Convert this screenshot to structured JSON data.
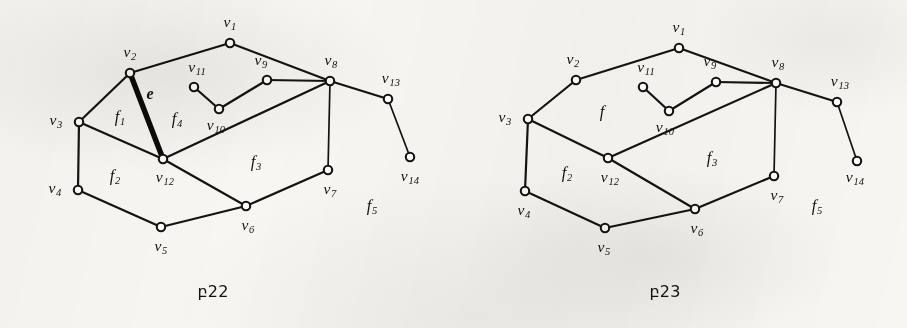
{
  "page": {
    "width": 907,
    "height": 328,
    "background_color": "#f7f6f3",
    "ink_color": "#15130f"
  },
  "chart_data": {
    "type": "diagram",
    "title": "",
    "figures": [
      {
        "id": "figure-22",
        "caption": "բ22",
        "caption_pos": {
          "x": 213,
          "y": 291
        },
        "vertices": [
          {
            "id": "v1",
            "label": "v",
            "sub": "1",
            "x": 230,
            "y": 43,
            "label_x": 230,
            "label_y": 23
          },
          {
            "id": "v2",
            "label": "v",
            "sub": "2",
            "x": 130,
            "y": 73,
            "label_x": 130,
            "label_y": 53
          },
          {
            "id": "v3",
            "label": "v",
            "sub": "3",
            "x": 79,
            "y": 122,
            "label_x": 56,
            "label_y": 121
          },
          {
            "id": "v4",
            "label": "v",
            "sub": "4",
            "x": 78,
            "y": 190,
            "label_x": 55,
            "label_y": 189
          },
          {
            "id": "v5",
            "label": "v",
            "sub": "5",
            "x": 161,
            "y": 227,
            "label_x": 161,
            "label_y": 247
          },
          {
            "id": "v6",
            "label": "v",
            "sub": "6",
            "x": 246,
            "y": 206,
            "label_x": 248,
            "label_y": 226
          },
          {
            "id": "v7",
            "label": "v",
            "sub": "7",
            "x": 328,
            "y": 170,
            "label_x": 330,
            "label_y": 190
          },
          {
            "id": "v8",
            "label": "v",
            "sub": "8",
            "x": 330,
            "y": 81,
            "label_x": 331,
            "label_y": 61
          },
          {
            "id": "v9",
            "label": "v",
            "sub": "9",
            "x": 267,
            "y": 80,
            "label_x": 261,
            "label_y": 61
          },
          {
            "id": "v10",
            "label": "v",
            "sub": "10",
            "x": 219,
            "y": 109,
            "label_x": 216,
            "label_y": 126
          },
          {
            "id": "v11",
            "label": "v",
            "sub": "11",
            "x": 194,
            "y": 87,
            "label_x": 197,
            "label_y": 68
          },
          {
            "id": "v12",
            "label": "v",
            "sub": "12",
            "x": 163,
            "y": 159,
            "label_x": 165,
            "label_y": 178
          },
          {
            "id": "v13",
            "label": "v",
            "sub": "13",
            "x": 388,
            "y": 99,
            "label_x": 391,
            "label_y": 79
          },
          {
            "id": "v14",
            "label": "v",
            "sub": "14",
            "x": 410,
            "y": 157,
            "label_x": 410,
            "label_y": 177
          }
        ],
        "edges": [
          {
            "from": "v1",
            "to": "v2",
            "style": "normal"
          },
          {
            "from": "v1",
            "to": "v8",
            "style": "normal"
          },
          {
            "from": "v2",
            "to": "v3",
            "style": "normal"
          },
          {
            "from": "v2",
            "to": "v12",
            "style": "bold"
          },
          {
            "from": "v3",
            "to": "v4",
            "style": "normal"
          },
          {
            "from": "v3",
            "to": "v12",
            "style": "normal"
          },
          {
            "from": "v4",
            "to": "v5",
            "style": "normal"
          },
          {
            "from": "v5",
            "to": "v6",
            "style": "normal"
          },
          {
            "from": "v6",
            "to": "v7",
            "style": "normal"
          },
          {
            "from": "v6",
            "to": "v12",
            "style": "normal"
          },
          {
            "from": "v7",
            "to": "v8",
            "style": "thin"
          },
          {
            "from": "v8",
            "to": "v9",
            "style": "normal"
          },
          {
            "from": "v8",
            "to": "v12",
            "style": "normal"
          },
          {
            "from": "v8",
            "to": "v13",
            "style": "normal"
          },
          {
            "from": "v9",
            "to": "v10",
            "style": "normal"
          },
          {
            "from": "v10",
            "to": "v11",
            "style": "normal"
          },
          {
            "from": "v13",
            "to": "v14",
            "style": "thin"
          }
        ],
        "face_labels": [
          {
            "label": "f",
            "sub": "1",
            "x": 120,
            "y": 118
          },
          {
            "label": "f",
            "sub": "2",
            "x": 115,
            "y": 177
          },
          {
            "label": "f",
            "sub": "3",
            "x": 256,
            "y": 163
          },
          {
            "label": "f",
            "sub": "4",
            "x": 177,
            "y": 120
          },
          {
            "label": "f",
            "sub": "5",
            "x": 372,
            "y": 207
          }
        ],
        "edge_labels": [
          {
            "label": "e",
            "sub": "",
            "x": 150,
            "y": 94
          }
        ]
      },
      {
        "id": "figure-23",
        "caption": "բ23",
        "caption_pos": {
          "x": 665,
          "y": 291
        },
        "vertices": [
          {
            "id": "v1",
            "label": "v",
            "sub": "1",
            "x": 679,
            "y": 48,
            "label_x": 679,
            "label_y": 28
          },
          {
            "id": "v2",
            "label": "v",
            "sub": "2",
            "x": 576,
            "y": 80,
            "label_x": 573,
            "label_y": 60
          },
          {
            "id": "v3",
            "label": "v",
            "sub": "3",
            "x": 528,
            "y": 119,
            "label_x": 505,
            "label_y": 118
          },
          {
            "id": "v4",
            "label": "v",
            "sub": "4",
            "x": 525,
            "y": 191,
            "label_x": 524,
            "label_y": 211
          },
          {
            "id": "v5",
            "label": "v",
            "sub": "5",
            "x": 605,
            "y": 228,
            "label_x": 604,
            "label_y": 248
          },
          {
            "id": "v6",
            "label": "v",
            "sub": "6",
            "x": 695,
            "y": 209,
            "label_x": 697,
            "label_y": 229
          },
          {
            "id": "v7",
            "label": "v",
            "sub": "7",
            "x": 774,
            "y": 176,
            "label_x": 777,
            "label_y": 196
          },
          {
            "id": "v8",
            "label": "v",
            "sub": "8",
            "x": 776,
            "y": 83,
            "label_x": 778,
            "label_y": 63
          },
          {
            "id": "v9",
            "label": "v",
            "sub": "9",
            "x": 716,
            "y": 82,
            "label_x": 710,
            "label_y": 62
          },
          {
            "id": "v10",
            "label": "v",
            "sub": "10",
            "x": 669,
            "y": 111,
            "label_x": 665,
            "label_y": 128
          },
          {
            "id": "v11",
            "label": "v",
            "sub": "11",
            "x": 643,
            "y": 87,
            "label_x": 646,
            "label_y": 68
          },
          {
            "id": "v12",
            "label": "v",
            "sub": "12",
            "x": 608,
            "y": 158,
            "label_x": 610,
            "label_y": 178
          },
          {
            "id": "v13",
            "label": "v",
            "sub": "13",
            "x": 837,
            "y": 102,
            "label_x": 840,
            "label_y": 82
          },
          {
            "id": "v14",
            "label": "v",
            "sub": "14",
            "x": 857,
            "y": 161,
            "label_x": 855,
            "label_y": 178
          }
        ],
        "edges": [
          {
            "from": "v1",
            "to": "v2",
            "style": "normal"
          },
          {
            "from": "v1",
            "to": "v8",
            "style": "normal"
          },
          {
            "from": "v2",
            "to": "v3",
            "style": "normal"
          },
          {
            "from": "v3",
            "to": "v4",
            "style": "normal"
          },
          {
            "from": "v3",
            "to": "v12",
            "style": "normal"
          },
          {
            "from": "v4",
            "to": "v5",
            "style": "normal"
          },
          {
            "from": "v5",
            "to": "v6",
            "style": "normal"
          },
          {
            "from": "v6",
            "to": "v7",
            "style": "normal"
          },
          {
            "from": "v6",
            "to": "v12",
            "style": "normal"
          },
          {
            "from": "v7",
            "to": "v8",
            "style": "thin"
          },
          {
            "from": "v8",
            "to": "v9",
            "style": "normal"
          },
          {
            "from": "v8",
            "to": "v12",
            "style": "normal"
          },
          {
            "from": "v8",
            "to": "v13",
            "style": "normal"
          },
          {
            "from": "v9",
            "to": "v10",
            "style": "normal"
          },
          {
            "from": "v10",
            "to": "v11",
            "style": "normal"
          },
          {
            "from": "v13",
            "to": "v14",
            "style": "thin"
          }
        ],
        "face_labels": [
          {
            "label": "f",
            "sub": "",
            "x": 602,
            "y": 112
          },
          {
            "label": "f",
            "sub": "2",
            "x": 567,
            "y": 174
          },
          {
            "label": "f",
            "sub": "3",
            "x": 712,
            "y": 159
          },
          {
            "label": "f",
            "sub": "5",
            "x": 817,
            "y": 207
          }
        ],
        "edge_labels": []
      }
    ]
  }
}
